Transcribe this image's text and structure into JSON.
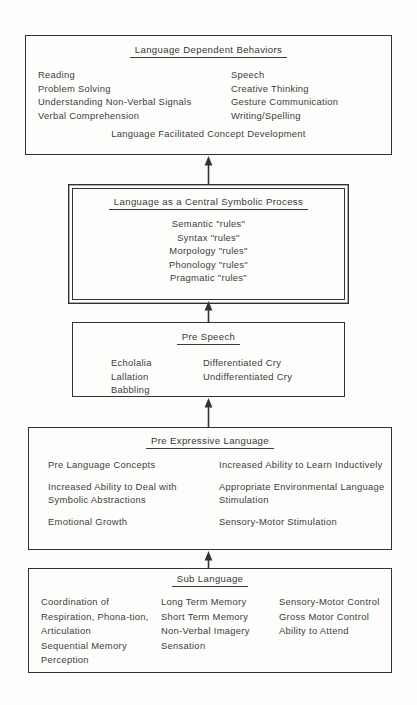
{
  "diagram": {
    "boxes": [
      {
        "id": "dependent-behaviors",
        "title": "Language Dependent Behaviors",
        "left_column": [
          "Reading",
          "Problem Solving",
          "Understanding Non-Verbal Signals",
          "Verbal Comprehension"
        ],
        "right_column": [
          "Speech",
          "Creative Thinking",
          "Gesture Communication",
          "Writing/Spelling"
        ],
        "footer": "Language Facilitated Concept Development"
      },
      {
        "id": "central-symbolic",
        "title": "Language as a Central Symbolic Process",
        "items": [
          "Semantic \"rules\"",
          "Syntax \"rules\"",
          "Morpology \"rules\"",
          "Phonology \"rules\"",
          "Pragmatic \"rules\""
        ]
      },
      {
        "id": "pre-speech",
        "title": "Pre Speech",
        "left_column": [
          "Echolalia",
          "Lallation",
          "Babbling"
        ],
        "right_column": [
          "Differentiated Cry",
          "Undifferentiated Cry"
        ]
      },
      {
        "id": "pre-expressive",
        "title": "Pre Expressive Language",
        "left_column": [
          "Pre Language Concepts",
          "Increased Ability to Deal with Symbolic Abstractions",
          "Emotional Growth"
        ],
        "right_column": [
          "Increased Ability to Learn Inductively",
          "Appropriate Environmental Language Stimulation",
          "Sensory-Motor Stimulation"
        ]
      },
      {
        "id": "sub-language",
        "title": "Sub Language",
        "column_1": [
          "Coordination of Respiration, Phona-tion, Articulation",
          "Sequential Memory",
          "Perception"
        ],
        "column_2": [
          "Long Term Memory",
          "Short Term Memory",
          "Non-Verbal Imagery",
          "Sensation"
        ],
        "column_3": [
          "Sensory-Motor Control",
          "Gross Motor Control",
          "Ability to Attend"
        ]
      }
    ],
    "arrows": [
      {
        "id": "to-dependent-behaviors",
        "direction": "up",
        "from": "central-symbolic",
        "to": "dependent-behaviors"
      },
      {
        "id": "to-central-symbolic",
        "direction": "up",
        "from": "pre-speech",
        "to": "central-symbolic"
      },
      {
        "id": "to-pre-speech",
        "direction": "up",
        "from": "pre-expressive",
        "to": "pre-speech"
      },
      {
        "id": "to-pre-expressive",
        "direction": "up",
        "from": "sub-language",
        "to": "pre-expressive"
      }
    ],
    "colors": {
      "background": "#fdfdfb",
      "border": "#333333",
      "text": "#3c3c3c",
      "arrow": "#333333"
    }
  }
}
